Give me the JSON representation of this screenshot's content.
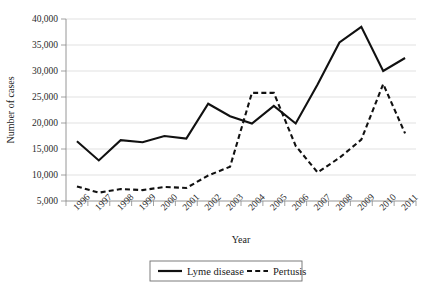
{
  "chart_data": {
    "type": "line",
    "title": "",
    "xlabel": "Year",
    "ylabel": "Number of cases",
    "grid": true,
    "legend_position": "bottom",
    "ylim": [
      5000,
      40000
    ],
    "ytick_labels": [
      "40,000",
      "35,000",
      "30,000",
      "25,000",
      "20,000",
      "15,000",
      "10,000",
      "5,000"
    ],
    "yticks": [
      40000,
      35000,
      30000,
      25000,
      20000,
      15000,
      10000,
      5000
    ],
    "categories": [
      "1996",
      "1997",
      "1998",
      "1999",
      "2000",
      "2001",
      "2002",
      "2003",
      "2004",
      "2005",
      "2006",
      "2007",
      "2008",
      "2009",
      "2010",
      "2011"
    ],
    "x": [
      1996,
      1997,
      1998,
      1999,
      2000,
      2001,
      2002,
      2003,
      2004,
      2005,
      2006,
      2007,
      2008,
      2009,
      2010,
      2011
    ],
    "series": [
      {
        "name": "Lyme disease",
        "style": "solid",
        "color": "#111111",
        "values": [
          16500,
          12800,
          16700,
          16300,
          17500,
          17000,
          23700,
          21300,
          19900,
          23300,
          19900,
          27400,
          35500,
          38500,
          30000,
          32500
        ]
      },
      {
        "name": "Pertusis",
        "style": "dashed",
        "color": "#111111",
        "values": [
          7800,
          6600,
          7300,
          7100,
          7700,
          7500,
          9900,
          11600,
          25800,
          25800,
          15600,
          10500,
          13300,
          16800,
          27500,
          18000
        ]
      }
    ]
  },
  "legend": {
    "entries": [
      {
        "label": "Lyme disease",
        "style": "solid"
      },
      {
        "label": "Pertusis",
        "style": "dashed"
      }
    ]
  }
}
